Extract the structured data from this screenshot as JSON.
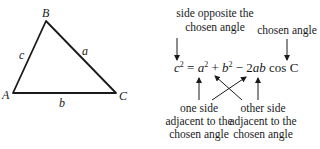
{
  "triangle": {
    "vertices": {
      "A": "A",
      "B": "B",
      "C": "C"
    },
    "sides": {
      "a": "a",
      "b": "b",
      "c": "c"
    }
  },
  "annotations": {
    "opposite": {
      "line1": "side opposite the",
      "line2": "chosen angle"
    },
    "chosen": {
      "line1": "chosen angle"
    },
    "adjacent_one": {
      "line1": "one side",
      "line2": "adjacent to the",
      "line3": "chosen angle"
    },
    "adjacent_other": {
      "line1": "other side",
      "line2": "adjacent to the",
      "line3": "chosen angle"
    }
  },
  "equation": {
    "lhs_var": "c",
    "lhs_exp": "2",
    "eq": " = ",
    "a_var": "a",
    "a_exp": "2",
    "plus": " + ",
    "b_var": "b",
    "b_exp": "2",
    "minus": " − ",
    "coef": "2",
    "ab": "ab",
    "cos": " cos ",
    "angle": "C"
  },
  "colors": {
    "ink": "#1a1a1a",
    "background": "#ffffff"
  }
}
